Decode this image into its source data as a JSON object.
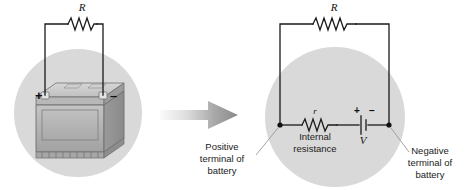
{
  "figure": {
    "background_color": "#ffffff",
    "circle_fill": "#d9d9d9",
    "wire_color": "#1a1a1a",
    "leader_color": "#9a9a9a"
  },
  "left_panel": {
    "name": "physical-battery-panel",
    "resistor_label": "R",
    "positive_label": "+",
    "negative_label": "–",
    "battery_colors": {
      "case_front": "#b3b3b3",
      "case_side": "#8f8f8f",
      "case_top": "#c9c9c9",
      "outline": "#6e6e6e",
      "terminal": "#e2e2e2"
    }
  },
  "arrow": {
    "name": "transform-arrow",
    "direction": "right",
    "color_start": "#f2f2f2",
    "color_end": "#8a8a8a"
  },
  "right_panel": {
    "name": "equivalent-circuit-panel",
    "external_resistor_label": "R",
    "internal_resistor_label": "r",
    "internal_resistance_caption_line1": "Internal",
    "internal_resistance_caption_line2": "resistance",
    "emf_label": "V",
    "emf_plus": "+",
    "emf_minus": "–",
    "positive_terminal_caption": [
      "Positive",
      "terminal of",
      "battery"
    ],
    "negative_terminal_caption": [
      "Negative",
      "terminal of",
      "battery"
    ]
  }
}
